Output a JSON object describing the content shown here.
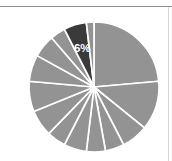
{
  "figure": {
    "background_color": "#ffffff",
    "width": 172,
    "height": 161,
    "top_rule_color": "#8d8d8d",
    "right_rule_color": "#d8d8d8"
  },
  "chart_data": {
    "type": "pie",
    "title": "",
    "subtitle": "",
    "xlabel": "",
    "ylabel": "",
    "grid": false,
    "legend": false,
    "legend_position": "none",
    "center": [
      94,
      87
    ],
    "radius": 65,
    "start_angle_deg": -90,
    "direction": "clockwise",
    "default_color": "#939393",
    "highlight_color": "#3a3a3a",
    "separator_color": "#ffffff",
    "label_color": "#ffffff",
    "labels_shown": [
      "6%"
    ],
    "categories": [
      "Slice 1",
      "Slice 2",
      "Slice 3",
      "Slice 4",
      "Slice 5",
      "Slice 6",
      "Slice 7",
      "Slice 8",
      "Slice 9",
      "Slice 10",
      "Slice 11",
      "Slice 12",
      "Slice 13",
      "Slice 14"
    ],
    "values": [
      25,
      13,
      7,
      5,
      5,
      6,
      5,
      7,
      8,
      7,
      6,
      4,
      6,
      2
    ],
    "slices": [
      {
        "label": "",
        "value": 25,
        "color": "#939393",
        "highlight": false,
        "show_label": false
      },
      {
        "label": "",
        "value": 13,
        "color": "#939393",
        "highlight": false,
        "show_label": false
      },
      {
        "label": "",
        "value": 7,
        "color": "#939393",
        "highlight": false,
        "show_label": false
      },
      {
        "label": "",
        "value": 5,
        "color": "#939393",
        "highlight": false,
        "show_label": false
      },
      {
        "label": "",
        "value": 5,
        "color": "#939393",
        "highlight": false,
        "show_label": false
      },
      {
        "label": "",
        "value": 6,
        "color": "#939393",
        "highlight": false,
        "show_label": false
      },
      {
        "label": "",
        "value": 5,
        "color": "#939393",
        "highlight": false,
        "show_label": false
      },
      {
        "label": "",
        "value": 7,
        "color": "#939393",
        "highlight": false,
        "show_label": false
      },
      {
        "label": "",
        "value": 8,
        "color": "#939393",
        "highlight": false,
        "show_label": false
      },
      {
        "label": "",
        "value": 7,
        "color": "#939393",
        "highlight": false,
        "show_label": false
      },
      {
        "label": "",
        "value": 6,
        "color": "#939393",
        "highlight": false,
        "show_label": false
      },
      {
        "label": "",
        "value": 4,
        "color": "#939393",
        "highlight": false,
        "show_label": false
      },
      {
        "label": "6%",
        "value": 6,
        "color": "#3a3a3a",
        "highlight": true,
        "show_label": true
      },
      {
        "label": "",
        "value": 2,
        "color": "#939393",
        "highlight": false,
        "show_label": false
      }
    ]
  }
}
